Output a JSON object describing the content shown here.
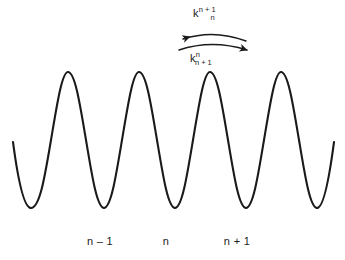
{
  "figure": {
    "background_color": "#ffffff",
    "stroke_color": "#1a1a1a",
    "text_color": "#1a1a1a",
    "width": 345,
    "height": 260
  },
  "rate_labels": {
    "forward": {
      "base": "k",
      "superscript": "n + 1",
      "subscript": "n",
      "text": "k_n^{n+1}"
    },
    "backward": {
      "base": "k",
      "superscript": "n",
      "subscript": "n + 1",
      "text": "k_{n+1}^{n}"
    }
  },
  "site_labels": {
    "left": "n – 1",
    "center": "n",
    "right": "n + 1"
  },
  "arrows": {
    "upper": {
      "name": "backward-transition-arrow",
      "direction": "left",
      "path": "M 183 39 Q 214 29 246 41",
      "head_at": "start"
    },
    "lower": {
      "name": "forward-transition-arrow",
      "direction": "right",
      "path": "M 179 50 Q 212 39 247 50",
      "head_at": "end"
    }
  },
  "chart_data": {
    "type": "line",
    "title": "",
    "xlabel": "",
    "ylabel": "",
    "grid": false,
    "legend_position": "none",
    "axis_visible": false,
    "curve_path": "M 13 142 C 18 180 24 208 31 208 C 40 208 45 175 51 140 C 57 104 62 72 68 72 C 75 72 80 104 86 140 C 92 176 97 208 104 208 C 111 208 116 176 122 140 C 128 104 133 72 139 72 C 146 72 151 104 157 140 C 163 176 168 208 175 208 C 182 208 187 176 193 140 C 199 104 204 72 210 72 C 217 72 222 104 228 140 C 234 176 239 208 246 208 C 253 208 258 176 264 140 C 270 104 275 72 281 72 C 288 72 293 104 299 140 C 305 176 310 208 317 208 C 323 208 329 180 334 142",
    "peaks_x": [
      68,
      139,
      210,
      281
    ],
    "peaks_y": [
      72,
      72,
      72,
      72
    ],
    "troughs_x": [
      31,
      104,
      175,
      246,
      317
    ],
    "troughs_y": [
      208,
      208,
      208,
      208,
      208
    ],
    "x_start": 13,
    "x_end": 334,
    "y_max_value": 72,
    "y_min_value": 208,
    "site_positions_x": [
      100,
      166,
      237
    ],
    "site_names": [
      "n – 1",
      "n",
      "n + 1"
    ],
    "stroke_width": 2.1
  }
}
